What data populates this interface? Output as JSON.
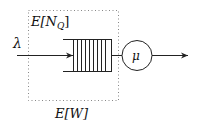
{
  "diagram": {
    "type": "single-server queue",
    "labels": {
      "arrival_rate": "λ",
      "service_rate": "μ",
      "queue_length": "E[N",
      "queue_length_sub": "Q",
      "queue_length_close": "]",
      "waiting_time": "E[W]"
    },
    "queue_slots": 10,
    "colors": {
      "stroke": "#222222",
      "dotted_box": "#888888",
      "background": "#ffffff"
    }
  }
}
